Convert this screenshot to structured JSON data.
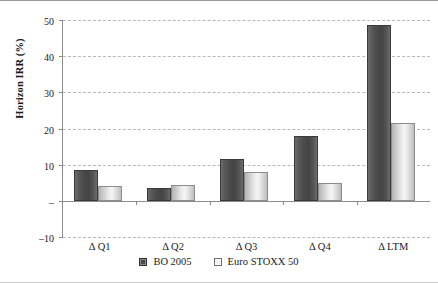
{
  "chart_data": {
    "type": "bar",
    "title": "",
    "xlabel": "",
    "ylabel": "Horizon IRR (%)",
    "categories": [
      "Δ Q1",
      "Δ Q2",
      "Δ Q3",
      "Δ Q4",
      "Δ LTM"
    ],
    "series": [
      {
        "name": "BO 2005",
        "values": [
          8.5,
          3.5,
          11.5,
          18.0,
          48.5
        ],
        "color": "#4a4a4a"
      },
      {
        "name": "Euro STOXX 50",
        "values": [
          4.0,
          4.5,
          8.0,
          5.0,
          21.5
        ],
        "color": "#f2f2f2"
      }
    ],
    "ylim": [
      -10,
      50
    ],
    "yticks": [
      50,
      40,
      30,
      20,
      10,
      0,
      -10
    ],
    "ytick_labels": [
      "50",
      "40",
      "30",
      "20",
      "10",
      "–",
      "–10"
    ],
    "grid": true,
    "legend_position": "bottom"
  }
}
